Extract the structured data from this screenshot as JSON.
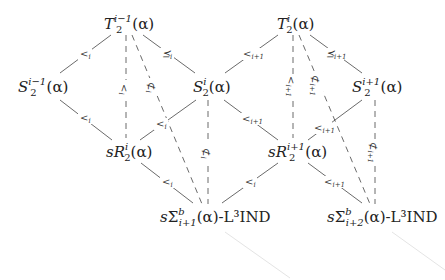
{
  "diagram": {
    "nodes": [
      {
        "id": "T2_im1",
        "base": "T",
        "sup": "i−1",
        "sub": "2",
        "arg": "(α)",
        "prefix": "",
        "suffix": ""
      },
      {
        "id": "S2_im1",
        "base": "S",
        "sup": "i−1",
        "sub": "2",
        "arg": "(α)",
        "prefix": "",
        "suffix": ""
      },
      {
        "id": "S2_i",
        "base": "S",
        "sup": "i",
        "sub": "2",
        "arg": "(α)",
        "prefix": "",
        "suffix": ""
      },
      {
        "id": "sR2_i",
        "base": "R",
        "sup": "i",
        "sub": "2",
        "arg": "(α)",
        "prefix": "s",
        "suffix": ""
      },
      {
        "id": "sSigma_ip1",
        "base": "Σ",
        "sup": "b",
        "sub": "i+1",
        "arg": "(α)",
        "prefix": "s",
        "suffix": "-L³IND"
      },
      {
        "id": "T2_i",
        "base": "T",
        "sup": "i",
        "sub": "2",
        "arg": "(α)",
        "prefix": "",
        "suffix": ""
      },
      {
        "id": "S2_ip1",
        "base": "S",
        "sup": "i+1",
        "sub": "2",
        "arg": "(α)",
        "prefix": "",
        "suffix": ""
      },
      {
        "id": "sR2_ip1",
        "base": "R",
        "sup": "i+1",
        "sub": "2",
        "arg": "(α)",
        "prefix": "s",
        "suffix": ""
      },
      {
        "id": "sSigma_ip2",
        "base": "Σ",
        "sup": "b",
        "sub": "i+2",
        "arg": "(α)",
        "prefix": "s",
        "suffix": "-L³IND"
      }
    ],
    "edges": [
      {
        "from": "T2_im1",
        "to": "S2_im1",
        "label": "<",
        "sub": "i",
        "style": "solid"
      },
      {
        "from": "T2_im1",
        "to": "S2_i",
        "label": "⪯",
        "sub": "i",
        "style": "solid"
      },
      {
        "from": "T2_im1",
        "to": "sR2_i",
        "label": "<",
        "sub": "i",
        "style": "dashed",
        "rotated": true
      },
      {
        "from": "T2_im1",
        "to": "sSigma_ip1",
        "label": "⊄",
        "sub": "i",
        "style": "dashed",
        "rotated": true
      },
      {
        "from": "S2_im1",
        "to": "sR2_i",
        "label": "<",
        "sub": "i",
        "style": "solid"
      },
      {
        "from": "S2_i",
        "to": "sR2_i",
        "label": "<",
        "sub": "i",
        "style": "solid"
      },
      {
        "from": "S2_i",
        "to": "sSigma_ip1",
        "label": "⊄",
        "sub": "i",
        "style": "dashed",
        "rotated": true
      },
      {
        "from": "sR2_i",
        "to": "sSigma_ip1",
        "label": "<",
        "sub": "i",
        "style": "solid"
      },
      {
        "from": "T2_i",
        "to": "S2_i",
        "label": "<",
        "sub": "i+1",
        "style": "solid"
      },
      {
        "from": "T2_i",
        "to": "S2_ip1",
        "label": "⪯",
        "sub": "i+1",
        "style": "solid"
      },
      {
        "from": "T2_i",
        "to": "sR2_ip1",
        "label": "<",
        "sub": "i+1",
        "style": "dashed",
        "rotated": true
      },
      {
        "from": "T2_i",
        "to": "sSigma_ip2",
        "label": "⊄",
        "sub": "i+1",
        "style": "dashed",
        "rotated": true
      },
      {
        "from": "S2_i",
        "to": "sR2_ip1",
        "label": "<",
        "sub": "i+1",
        "style": "solid"
      },
      {
        "from": "S2_ip1",
        "to": "sR2_ip1",
        "label": "<",
        "sub": "i+1",
        "style": "solid"
      },
      {
        "from": "S2_ip1",
        "to": "sSigma_ip2",
        "label": "⊄",
        "sub": "i+1",
        "style": "dashed",
        "rotated": true
      },
      {
        "from": "sR2_ip1",
        "to": "sSigma_ip1",
        "label": "<",
        "sub": "i",
        "style": "solid"
      },
      {
        "from": "sR2_ip1",
        "to": "sSigma_ip2",
        "label": "<",
        "sub": "i+1",
        "style": "solid"
      }
    ]
  }
}
